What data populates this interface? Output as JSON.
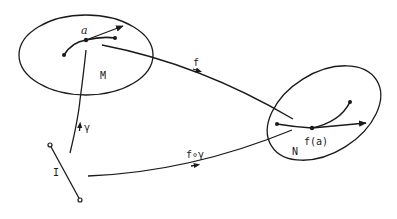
{
  "diagram": {
    "type": "manifold-mapping",
    "colors": {
      "ink": "#1a1a1a",
      "background": "#ffffff"
    },
    "nodes": {
      "M": {
        "label": "M"
      },
      "N": {
        "label": "N"
      },
      "I": {
        "label": "I"
      }
    },
    "points": {
      "a": {
        "label": "a"
      },
      "fa": {
        "label": "f(a)"
      }
    },
    "edges": {
      "f": {
        "label": "f",
        "from": "M",
        "to": "N"
      },
      "gamma": {
        "label": "γ",
        "from": "I",
        "to": "M"
      },
      "f_gamma": {
        "label": "f∘γ",
        "from": "I",
        "to": "N"
      }
    }
  }
}
